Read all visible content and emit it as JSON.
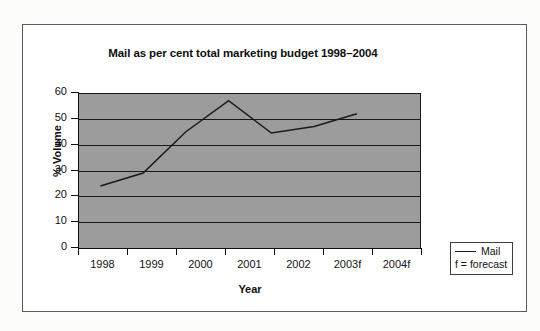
{
  "chart_data": {
    "type": "line",
    "title": "Mail as per cent total marketing budget 1998–2004",
    "xlabel": "Year",
    "ylabel": "% Volume",
    "categories": [
      "1998",
      "1999",
      "2000",
      "2001",
      "2002",
      "2003f",
      "2004f"
    ],
    "series": [
      {
        "name": "Mail",
        "values": [
          24,
          29,
          45,
          57,
          44.5,
          47,
          52
        ]
      }
    ],
    "ylim": [
      0,
      60
    ],
    "yticks": [
      "0",
      "10",
      "20",
      "30",
      "40",
      "50",
      "60"
    ],
    "grid": "horizontal",
    "legend_position": "right-bottom-outside",
    "legend_entries": [
      {
        "label": "Mail",
        "marker": "line"
      }
    ],
    "annotations": [
      {
        "text": "f = forecast"
      }
    ],
    "plot_background": "#9c9c9c",
    "line_color": "#1a1a1a",
    "axis_color": "#101010"
  }
}
